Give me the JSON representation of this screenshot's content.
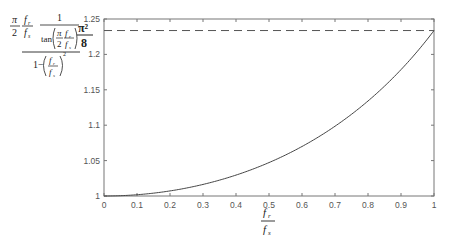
{
  "chart_data": {
    "type": "line",
    "title": "",
    "ylabel": "(π/2 · f_r/f_s) · 1/tan(π/2 · f_r/f_s) / (1 − (f_r/f_s)²)",
    "xlabel": "f_r / f_s",
    "xlim": [
      0,
      1
    ],
    "ylim": [
      1,
      1.25
    ],
    "grid": false,
    "legend": null,
    "x_ticks": [
      "0",
      "0.1",
      "0.2",
      "0.3",
      "0.4",
      "0.5",
      "0.6",
      "0.7",
      "0.8",
      "0.9",
      "1"
    ],
    "y_ticks": [
      "1",
      "1.05",
      "1.1",
      "1.15",
      "1.2",
      "1.25"
    ],
    "x": [
      0,
      0.1,
      0.2,
      0.3,
      0.4,
      0.5,
      0.6,
      0.7,
      0.8,
      0.9,
      1.0
    ],
    "series": [
      {
        "name": "ratio",
        "style": "solid",
        "values": [
          1.0,
          1.0018,
          1.0072,
          1.0163,
          1.0295,
          1.0472,
          1.0699,
          1.0985,
          1.1342,
          1.1785,
          1.2337
        ]
      },
      {
        "name": "π²/8 asymptote",
        "style": "dashed",
        "values": [
          1.2337,
          1.2337,
          1.2337,
          1.2337,
          1.2337,
          1.2337,
          1.2337,
          1.2337,
          1.2337,
          1.2337,
          1.2337
        ]
      }
    ],
    "annotations": [
      {
        "text_num": "π²",
        "text_den": "8",
        "value": 1.2337,
        "position": "left of y-axis at dashed line"
      }
    ]
  },
  "labels": {
    "pi": "π",
    "two": "2",
    "one": "1",
    "f": "f",
    "sub_r": "r",
    "sub_s": "s",
    "tan": "tan",
    "one_minus": "1−",
    "sq": "2",
    "pi_sq": "π²",
    "eight": "8"
  }
}
